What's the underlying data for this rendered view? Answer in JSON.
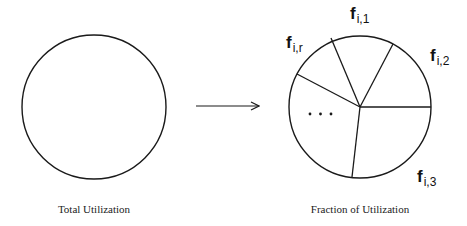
{
  "diagram": {
    "left": {
      "caption": "Total Utilization",
      "circle": {
        "cx": 94,
        "cy": 107,
        "r": 72
      }
    },
    "arrow": {
      "x1": 196,
      "y1": 106,
      "x2": 259,
      "y2": 106
    },
    "right": {
      "caption": "Fraction of Utilization",
      "pie": {
        "cx": 360,
        "cy": 107,
        "r": 71
      },
      "spokes": [
        {
          "x": 331,
          "y": 38
        },
        {
          "x": 393,
          "y": 44
        },
        {
          "x": 431,
          "y": 107
        },
        {
          "x": 352,
          "y": 177
        },
        {
          "x": 297,
          "y": 74
        }
      ],
      "ellipsis": "...",
      "labels": [
        {
          "main": "f",
          "sub": "i,1",
          "x": 350,
          "y": 19
        },
        {
          "main": "f",
          "sub": "i,2",
          "x": 430,
          "y": 61
        },
        {
          "main": "f",
          "sub": "i,3",
          "x": 417,
          "y": 182
        },
        {
          "main": "f",
          "sub": "i,r",
          "x": 286,
          "y": 48
        }
      ]
    },
    "colors": {
      "stroke": "#1a1a1a",
      "text": "#222222"
    }
  }
}
